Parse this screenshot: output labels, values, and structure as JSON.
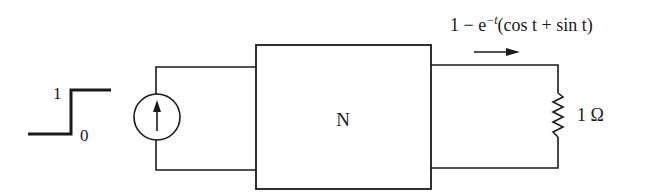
{
  "diagram": {
    "type": "circuit",
    "step_input": {
      "high_label": "1",
      "low_label": "0"
    },
    "source": {
      "kind": "current-source",
      "direction": "up"
    },
    "network": {
      "label": "N"
    },
    "output_current": {
      "expression": "1 − e^{−t}(cos t + sin t)",
      "base": "1 − e",
      "exponent": "−t",
      "rest": "(cos t + sin t)",
      "direction": "right"
    },
    "load": {
      "kind": "resistor",
      "label": "1 Ω"
    },
    "colors": {
      "stroke": "#1a1a1a",
      "background": "#ffffff"
    }
  }
}
